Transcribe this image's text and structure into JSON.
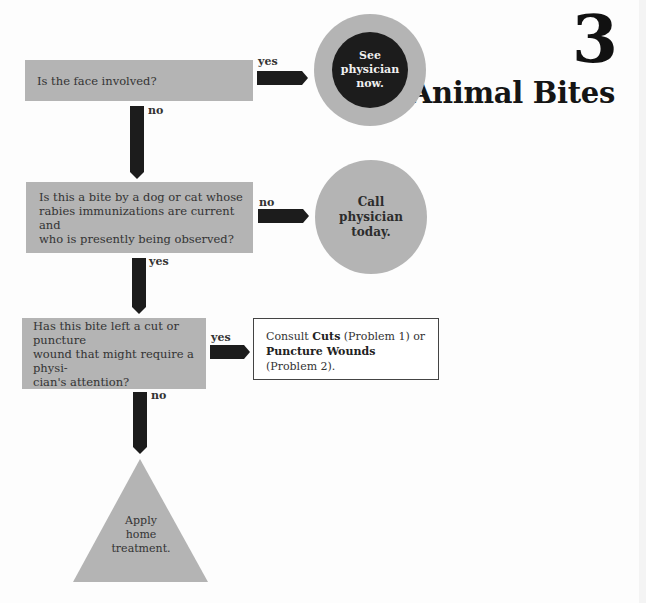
{
  "header": {
    "chapter_number": "3",
    "chapter_title": "Animal Bites"
  },
  "flowchart": {
    "questions": [
      {
        "id": "q1",
        "text": "Is the face involved?"
      },
      {
        "id": "q2",
        "lines": [
          "Is this a bite by a dog or cat whose",
          "rabies immunizations are current and",
          "who is presently being observed?"
        ]
      },
      {
        "id": "q3",
        "lines": [
          "Has this bite left a cut or puncture",
          "wound that might require a physi-",
          "cian's attention?"
        ]
      }
    ],
    "branch_labels": {
      "q1_right": "yes",
      "q1_down": "no",
      "q2_right": "no",
      "q2_down": "yes",
      "q3_right": "yes",
      "q3_down": "no"
    },
    "outcomes": {
      "see_physician_now": [
        "See",
        "physician",
        "now."
      ],
      "call_physician_today": [
        "Call",
        "physician",
        "today."
      ],
      "consult": {
        "prefix": "Consult ",
        "ref1_bold": "Cuts",
        "ref1_suffix": " (Problem 1) or",
        "ref2_bold": "Puncture Wounds",
        "ref2_suffix": " (Problem 2)."
      },
      "home_treatment": [
        "Apply",
        "home",
        "treatment."
      ]
    }
  },
  "colors": {
    "box_gray": "#b4b4b4",
    "arrow_dark": "#1c1c1c",
    "urgent_circle_center": "#1c1c1c",
    "background": "#fdfdfd"
  }
}
